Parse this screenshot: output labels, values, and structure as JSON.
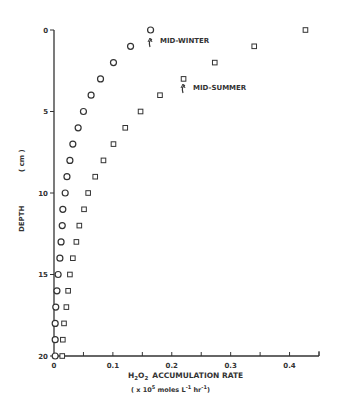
{
  "chart_data": {
    "type": "scatter",
    "title": "",
    "xlabel": "H2O2 ACCUMULATION RATE",
    "xlabel_units": "( x 10^5 moles L^-1 hr^-1 )",
    "ylabel": "DEPTH",
    "ylabel_units": "( cm )",
    "xlim": [
      0,
      0.45
    ],
    "ylim": [
      20,
      0
    ],
    "y_inverted": true,
    "x_ticks": [
      0,
      0.1,
      0.2,
      0.3,
      0.4
    ],
    "x_tick_labels": [
      "0",
      "0.1",
      "0.2",
      "0.3",
      "0.4"
    ],
    "y_ticks": [
      0,
      5,
      10,
      15,
      20
    ],
    "y_tick_labels": [
      "0",
      "5",
      "10",
      "15",
      "20"
    ],
    "grid": false,
    "series": [
      {
        "name": "MID-WINTER",
        "marker": "circle",
        "depth": [
          0,
          1,
          2,
          3,
          4,
          5,
          6,
          7,
          8,
          9,
          10,
          11,
          12,
          13,
          14,
          15,
          16,
          17,
          18,
          19,
          20
        ],
        "values": [
          0.164,
          0.13,
          0.101,
          0.079,
          0.063,
          0.05,
          0.041,
          0.032,
          0.027,
          0.022,
          0.019,
          0.015,
          0.014,
          0.012,
          0.01,
          0.007,
          0.005,
          0.003,
          0.002,
          0.002,
          0.002
        ]
      },
      {
        "name": "MID-SUMMER",
        "marker": "square",
        "depth": [
          0,
          1,
          2,
          3,
          4,
          5,
          6,
          7,
          8,
          9,
          10,
          11,
          12,
          13,
          14,
          15,
          16,
          17,
          18,
          19,
          20
        ],
        "values": [
          0.427,
          0.34,
          0.273,
          0.22,
          0.18,
          0.147,
          0.121,
          0.101,
          0.084,
          0.07,
          0.058,
          0.051,
          0.043,
          0.038,
          0.032,
          0.027,
          0.024,
          0.021,
          0.017,
          0.015,
          0.014
        ]
      }
    ],
    "annotations": [
      {
        "text": "MID-WINTER",
        "points_to": {
          "series": "MID-WINTER",
          "depth": 0
        }
      },
      {
        "text": "MID-SUMMER",
        "points_to": {
          "series": "MID-SUMMER",
          "depth": 3
        }
      }
    ]
  },
  "labels": {
    "xlabel_main": "ACCUMULATION RATE",
    "xlabel_units_prefix": "( x 10",
    "xlabel_units_exp": "5",
    "xlabel_units_mid": " moles L",
    "xlabel_units_exp2": "-1",
    "xlabel_units_mid2": " hr",
    "xlabel_units_exp3": "-1",
    "xlabel_units_suffix": ")",
    "ylabel": "DEPTH",
    "ylabel_units": "( cm )",
    "annotation_winter": "MID-WINTER",
    "annotation_summer": "MID-SUMMER"
  },
  "colors": {
    "ink": "#333333",
    "background": "#ffffff"
  }
}
